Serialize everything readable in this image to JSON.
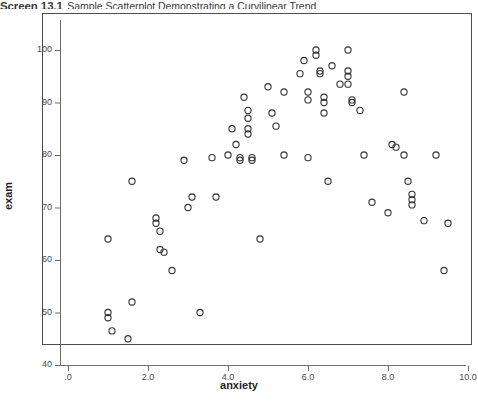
{
  "caption": {
    "number": "Screen 13.1",
    "text": "Sample Scatterplot Demonstrating a Curvilinear Trend"
  },
  "chart_data": {
    "type": "scatter",
    "title": "Screen 13.1 Sample Scatterplot Demonstrating a Curvilinear Trend",
    "xlabel": "anxiety",
    "ylabel": "exam",
    "xlim": [
      -0.45,
      10.2
    ],
    "ylim": [
      40,
      103
    ],
    "grid": false,
    "legend": null,
    "marker": "open-circle",
    "marker_color": "#333333",
    "xticks": [
      0,
      2,
      4,
      6,
      8,
      10
    ],
    "xtick_labels": [
      ".0",
      "2.0",
      "4.0",
      "6.0",
      "8.0",
      "10.0"
    ],
    "yticks": [
      40,
      50,
      60,
      70,
      80,
      90,
      100
    ],
    "ytick_labels": [
      "40",
      "50",
      "60",
      "70",
      "80",
      "90",
      "100"
    ],
    "n_points": 74,
    "points": [
      [
        1.0,
        64.0
      ],
      [
        1.0,
        50.0
      ],
      [
        1.0,
        49.0
      ],
      [
        1.1,
        46.5
      ],
      [
        1.5,
        45.0
      ],
      [
        1.6,
        75.0
      ],
      [
        1.6,
        52.0
      ],
      [
        2.2,
        68.0
      ],
      [
        2.2,
        67.0
      ],
      [
        2.3,
        65.5
      ],
      [
        2.3,
        62.0
      ],
      [
        2.4,
        61.5
      ],
      [
        2.6,
        58.0
      ],
      [
        2.9,
        79.0
      ],
      [
        3.0,
        70.0
      ],
      [
        3.1,
        72.0
      ],
      [
        3.3,
        50.0
      ],
      [
        3.6,
        79.5
      ],
      [
        3.7,
        72.0
      ],
      [
        4.0,
        80.0
      ],
      [
        4.1,
        85.0
      ],
      [
        4.2,
        82.0
      ],
      [
        4.3,
        79.5
      ],
      [
        4.3,
        79.0
      ],
      [
        4.4,
        91.0
      ],
      [
        4.5,
        88.5
      ],
      [
        4.5,
        87.0
      ],
      [
        4.5,
        85.0
      ],
      [
        4.5,
        84.0
      ],
      [
        4.6,
        79.5
      ],
      [
        4.6,
        79.0
      ],
      [
        4.8,
        64.0
      ],
      [
        5.0,
        93.0
      ],
      [
        5.1,
        88.0
      ],
      [
        5.2,
        85.5
      ],
      [
        5.4,
        92.0
      ],
      [
        5.4,
        80.0
      ],
      [
        5.8,
        95.5
      ],
      [
        5.9,
        98.0
      ],
      [
        6.0,
        92.0
      ],
      [
        6.0,
        90.5
      ],
      [
        6.0,
        79.5
      ],
      [
        6.2,
        100.0
      ],
      [
        6.2,
        99.0
      ],
      [
        6.3,
        96.0
      ],
      [
        6.3,
        95.5
      ],
      [
        6.4,
        91.0
      ],
      [
        6.4,
        90.0
      ],
      [
        6.4,
        88.0
      ],
      [
        6.5,
        75.0
      ],
      [
        6.6,
        97.0
      ],
      [
        6.8,
        93.5
      ],
      [
        7.0,
        100.0
      ],
      [
        7.0,
        96.0
      ],
      [
        7.0,
        95.0
      ],
      [
        7.0,
        93.5
      ],
      [
        7.1,
        90.5
      ],
      [
        7.1,
        90.0
      ],
      [
        7.3,
        88.5
      ],
      [
        7.4,
        80.0
      ],
      [
        7.6,
        71.0
      ],
      [
        8.0,
        69.0
      ],
      [
        8.1,
        82.0
      ],
      [
        8.2,
        81.5
      ],
      [
        8.4,
        92.0
      ],
      [
        8.4,
        80.0
      ],
      [
        8.5,
        75.0
      ],
      [
        8.6,
        72.5
      ],
      [
        8.6,
        71.5
      ],
      [
        8.6,
        70.5
      ],
      [
        8.9,
        67.5
      ],
      [
        9.2,
        80.0
      ],
      [
        9.4,
        58.0
      ],
      [
        9.5,
        67.0
      ]
    ]
  }
}
